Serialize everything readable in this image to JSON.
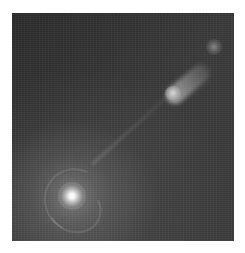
{
  "image": {
    "description": "Grayscale astronomical image of a galaxy with a bright nucleus at lower left and a jet extending to the upper right",
    "features": [
      {
        "name": "bright-nucleus",
        "position": "lower-left"
      },
      {
        "name": "jet-knot",
        "position": "upper-right"
      },
      {
        "name": "jet-terminal-knot",
        "position": "top-right"
      }
    ],
    "colors": {
      "background": "#333333",
      "nucleus": "#ffffff",
      "page": "#ffffff"
    }
  }
}
